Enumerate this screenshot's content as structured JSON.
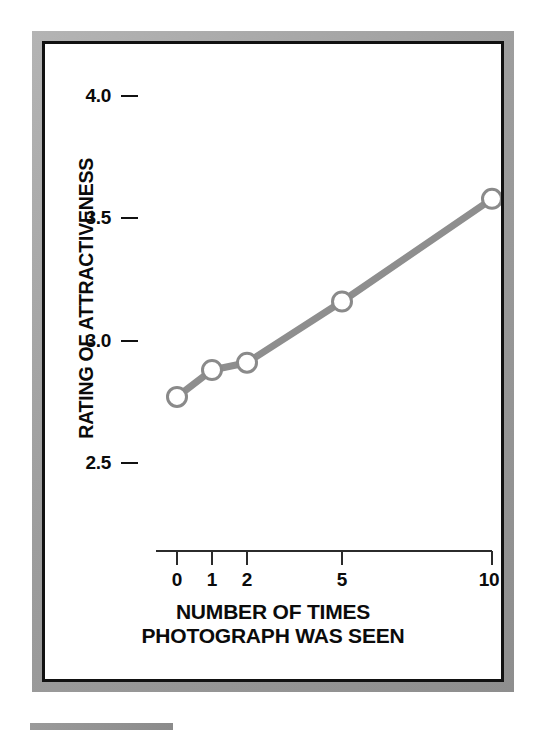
{
  "figure": {
    "background_color": "#ffffff",
    "frame_color": "#9d9d9d",
    "inner_border_color": "#111111",
    "line_color": "#8c8c8c",
    "marker_fill": "#ffffff",
    "marker_stroke": "#8c8c8c",
    "axis_color": "#2b2b2b",
    "text_color": "#0b0b0b"
  },
  "chart_data": {
    "type": "line",
    "title": "",
    "subtitle": "",
    "xlabel": "NUMBER OF TIMES PHOTOGRAPH WAS SEEN",
    "xlabel_line1": "NUMBER OF TIMES",
    "xlabel_line2": "PHOTOGRAPH WAS SEEN",
    "ylabel": "RATING OF ATTRACTIVENESS",
    "categories": [
      "0",
      "1",
      "2",
      "5",
      "10"
    ],
    "x": [
      0,
      1,
      2,
      5,
      10
    ],
    "values": [
      2.77,
      2.88,
      2.91,
      3.16,
      3.58
    ],
    "series": [
      {
        "name": "Rating of attractiveness",
        "values": [
          2.77,
          2.88,
          2.91,
          3.16,
          3.58
        ]
      }
    ],
    "xtick_labels": [
      "0",
      "1",
      "2",
      "5",
      "10"
    ],
    "ytick_labels": [
      "4.0",
      "3.5",
      "3.0",
      "2.5"
    ],
    "yticks": [
      4.0,
      3.5,
      3.0,
      2.5
    ],
    "ylim": [
      2.5,
      4.0
    ],
    "grid": false,
    "legend": false,
    "legend_position": "none",
    "marker": "open-circle",
    "x_axis_style": "ordinal-spaced"
  },
  "layout": {
    "y_pixels": {
      "4.0": 52,
      "3.5": 174,
      "3.0": 297,
      "2.5": 419
    },
    "x_pixels": {
      "0": 132,
      "1": 167,
      "2": 202,
      "5": 297,
      "10": 447
    },
    "axis_line_x_start": 111,
    "axis_line_x_end": 447,
    "axis_line_y": 507,
    "tick_length": 14
  },
  "caption": {
    "rule_color": "#8f8f8f"
  }
}
